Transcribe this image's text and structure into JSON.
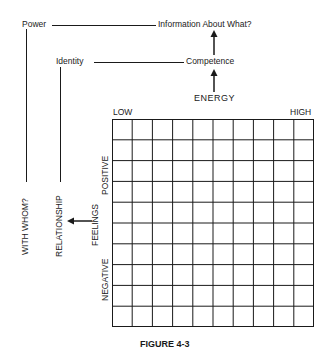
{
  "diagram": {
    "nodes": {
      "power": "Power",
      "information": "Information About What?",
      "identity": "Identity",
      "competence": "Competence",
      "energy": "ENERGY",
      "with_whom": "WITH WHOM?",
      "relationship": "RELATIONSHIP",
      "feelings": "FEELINGS"
    },
    "grid": {
      "rows": 10,
      "cols": 10,
      "x_axis_low": "LOW",
      "x_axis_high": "HIGH",
      "y_axis_positive": "POSITIVE",
      "y_axis_negative": "NEGATIVE"
    },
    "caption": "FIGURE 4-3",
    "edges": [
      {
        "from": "Power",
        "to": "Information About What?",
        "type": "line"
      },
      {
        "from": "Competence",
        "to": "Information About What?",
        "type": "arrow"
      },
      {
        "from": "Identity",
        "to": "Competence",
        "type": "line"
      },
      {
        "from": "ENERGY",
        "to": "Competence",
        "type": "arrow"
      },
      {
        "from": "Power",
        "to": "WITH WHOM?",
        "type": "line"
      },
      {
        "from": "Identity",
        "to": "RELATIONSHIP",
        "type": "line"
      },
      {
        "from": "FEELINGS",
        "to": "RELATIONSHIP",
        "type": "arrow"
      }
    ]
  }
}
